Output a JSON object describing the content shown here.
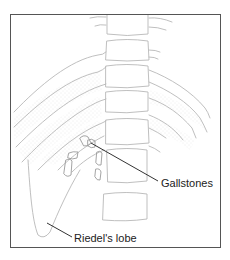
{
  "figure": {
    "type": "anatomical-illustration",
    "labels": {
      "gallstones": "Gallstones",
      "riedels_lobe": "Riedel's lobe"
    },
    "colors": {
      "frame": "#555555",
      "outline": "#b8b8b8",
      "leader_line": "#333333",
      "text": "#222222",
      "stipple": "#d4d4d4"
    },
    "vertebrae_count": 7,
    "gallstone_count": 6
  }
}
